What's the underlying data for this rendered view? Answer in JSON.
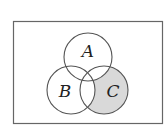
{
  "diagram": {
    "type": "venn",
    "universe_label": "",
    "sets": [
      {
        "id": "A",
        "label": "A"
      },
      {
        "id": "B",
        "label": "B"
      },
      {
        "id": "C",
        "label": "C"
      }
    ],
    "shaded_region": "C minus (A union B)",
    "colors": {
      "stroke": "#555555",
      "shade": "#d9d9d9",
      "background": "#ffffff",
      "border": "#666666"
    }
  }
}
